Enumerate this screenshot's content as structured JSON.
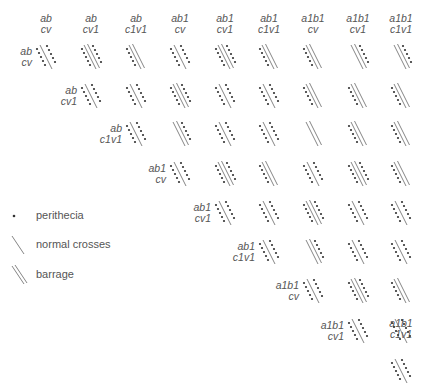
{
  "genotypes": [
    {
      "line1": "ab",
      "line2": "cv"
    },
    {
      "line1": "ab",
      "line2": "cv1"
    },
    {
      "line1": "ab",
      "line2": "c1v1"
    },
    {
      "line1": "ab1",
      "line2": "cv"
    },
    {
      "line1": "ab1",
      "line2": "cv1"
    },
    {
      "line1": "ab1",
      "line2": "c1v1"
    },
    {
      "line1": "a1b1",
      "line2": "cv"
    },
    {
      "line1": "a1b1",
      "line2": "cv1"
    },
    {
      "line1": "a1b1",
      "line2": "c1v1"
    }
  ],
  "matrix": [
    [
      "S-both",
      "D-both",
      "D-left",
      "S-both",
      "D-both",
      "D-left",
      "D-left",
      "D-right",
      "D-right"
    ],
    [
      null,
      "S-both",
      "S-both",
      "D-both",
      "S-both",
      "S-both",
      "D-left",
      "D-left",
      "D-left"
    ],
    [
      null,
      null,
      "S-both",
      "D-right",
      "S-both",
      "S-both",
      "D-none",
      "D-left",
      "D-left"
    ],
    [
      null,
      null,
      null,
      "S-both",
      "D-both",
      "D-left",
      "S-both",
      "D-both",
      "D-left"
    ],
    [
      null,
      null,
      null,
      null,
      "S-both",
      "S-both",
      "D-both",
      "S-both",
      "S-both"
    ],
    [
      null,
      null,
      null,
      null,
      null,
      "S-both",
      "D-right",
      "S-both",
      "S-both"
    ],
    [
      null,
      null,
      null,
      null,
      null,
      null,
      "S-both",
      "D-both",
      "D-left"
    ],
    [
      null,
      null,
      null,
      null,
      null,
      null,
      null,
      "S-both",
      "S-both"
    ],
    [
      null,
      null,
      null,
      null,
      null,
      null,
      null,
      null,
      "S-both"
    ]
  ],
  "legend": {
    "perithecia": "perithecia",
    "normal": "normal crosses",
    "barrage": "barrage"
  },
  "colors": {
    "line": "#666666",
    "dot": "#333333",
    "text": "#555555"
  }
}
